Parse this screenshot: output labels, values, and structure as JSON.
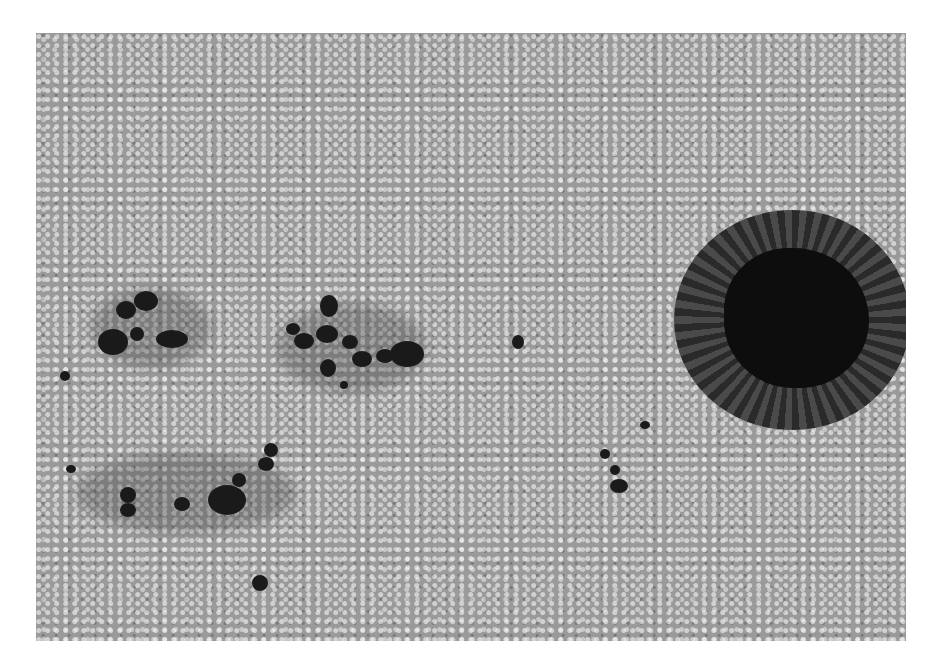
{
  "image": {
    "subject": "solar photosphere with sunspots and granulation",
    "background_color": "#ffffff",
    "photo_box": {
      "left": 36,
      "top": 33,
      "width": 870,
      "height": 608
    },
    "colors": {
      "granulation_mid": "#9a9a9a",
      "granule_bright": "#e0e0e0",
      "umbra": "#0d0d0d",
      "penumbra": "#3a3a3a"
    },
    "features": [
      {
        "name": "large-sunspot",
        "cx": 790,
        "cy": 318,
        "r": 110
      },
      {
        "name": "pore-group-upper-left",
        "cx": 140,
        "cy": 325
      },
      {
        "name": "pore-group-center",
        "cx": 355,
        "cy": 345
      },
      {
        "name": "pore-group-lower-left",
        "cx": 200,
        "cy": 485
      },
      {
        "name": "pore-group-lower-right",
        "cx": 620,
        "cy": 470
      }
    ]
  }
}
